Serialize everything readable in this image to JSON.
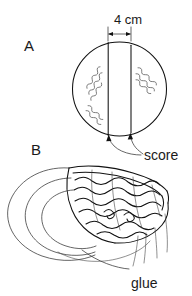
{
  "figure": {
    "title": "",
    "background_color": "#ffffff",
    "ink_color": "#111111",
    "width": 192,
    "height": 296
  },
  "panels": [
    {
      "id": "A",
      "label": "A",
      "description": "circle with two parallel vertical score lines"
    },
    {
      "id": "B",
      "label": "B",
      "description": "folded rolled shell form with wavy texture"
    }
  ],
  "dimension": {
    "value": "4 cm",
    "number": "4",
    "unit": "cm"
  },
  "callouts": [
    {
      "id": "score",
      "label": "score"
    },
    {
      "id": "glue",
      "label": "glue"
    }
  ],
  "labels": {
    "panel_a": "A",
    "panel_b": "B",
    "dimension": "4 cm",
    "score": "score",
    "glue": "glue"
  }
}
